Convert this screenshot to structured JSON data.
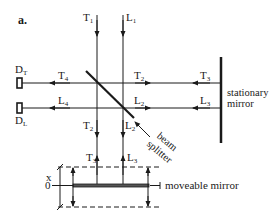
{
  "panel_label": "a.",
  "beams": {
    "T1": {
      "letter": "T",
      "sub": "1"
    },
    "L1": {
      "letter": "L",
      "sub": "1"
    },
    "T2_h": {
      "letter": "T",
      "sub": "2"
    },
    "L2_h": {
      "letter": "L",
      "sub": "2"
    },
    "T3_h": {
      "letter": "T",
      "sub": "3"
    },
    "L3_h": {
      "letter": "L",
      "sub": "3"
    },
    "T4": {
      "letter": "T",
      "sub": "4"
    },
    "L4": {
      "letter": "L",
      "sub": "4"
    },
    "T2_v": {
      "letter": "T",
      "sub": "2"
    },
    "L2_v": {
      "letter": "L",
      "sub": "2"
    },
    "T3_v": {
      "letter": "T",
      "sub": "3"
    },
    "L3_v": {
      "letter": "L",
      "sub": "3"
    }
  },
  "detectors": {
    "DT": {
      "letter": "D",
      "sub": "T"
    },
    "DL": {
      "letter": "D",
      "sub": "L"
    }
  },
  "labels": {
    "stationary_mirror_line1": "stationary",
    "stationary_mirror_line2": "mirror",
    "beam_splitter_line1": "beam",
    "beam_splitter_line2": "splitter",
    "moveable_mirror": "moveable mirror",
    "axis_x": "x",
    "axis_zero": "0"
  },
  "colors": {
    "ink": "#1a1a1a",
    "background": "#ffffff"
  }
}
